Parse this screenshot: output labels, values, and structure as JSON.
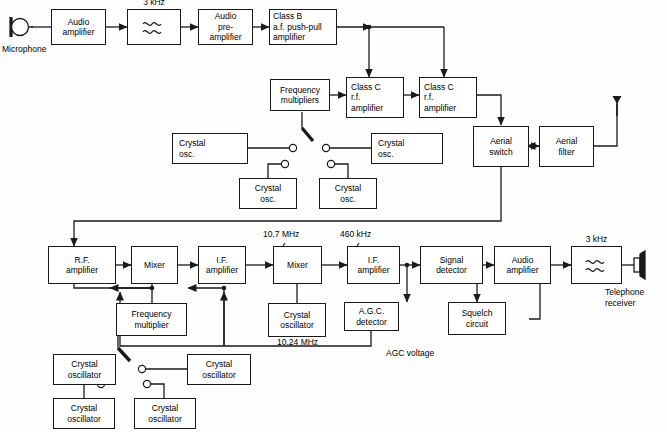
{
  "diagram": {
    "transmitter": {
      "microphone_label": "Microphone",
      "blocks": [
        {
          "id": "audio-amplifier-tx",
          "lines": [
            "Audio",
            "amplifier"
          ]
        },
        {
          "id": "af-filter-tx",
          "lines": []
        },
        {
          "id": "audio-pre-amplifier",
          "lines": [
            "Audio",
            "pre-",
            "amplifier"
          ]
        },
        {
          "id": "class-b-af-push-pull-amplifier",
          "lines": [
            "Class B",
            "a.f. push-pull",
            "amplifier"
          ]
        },
        {
          "id": "frequency-multipliers",
          "lines": [
            "Frequency",
            "multipliers"
          ]
        },
        {
          "id": "class-c-rf-amplifier-1",
          "lines": [
            "Class C",
            "r.f.",
            "amplifier"
          ]
        },
        {
          "id": "class-c-rf-amplifier-2",
          "lines": [
            "Class C",
            "r.f.",
            "amplifier"
          ]
        },
        {
          "id": "aerial-switch",
          "lines": [
            "Aerial",
            "switch"
          ]
        },
        {
          "id": "aerial-filter",
          "lines": [
            "Aerial",
            "filter"
          ]
        }
      ],
      "filter_label": "3 kHz",
      "crystal_oscillators": [
        {
          "id": "tx-xo-1",
          "lines": [
            "Crystal",
            "osc."
          ]
        },
        {
          "id": "tx-xo-2",
          "lines": [
            "Crystal",
            "osc."
          ]
        },
        {
          "id": "tx-xo-3",
          "lines": [
            "Crystal",
            "osc."
          ]
        },
        {
          "id": "tx-xo-4",
          "lines": [
            "Crystal",
            "osc."
          ]
        }
      ]
    },
    "receiver": {
      "blocks": [
        {
          "id": "rf-amplifier",
          "lines": [
            "R.F.",
            "amplifier"
          ]
        },
        {
          "id": "mixer-1",
          "lines": [
            "Mixer"
          ]
        },
        {
          "id": "if-amplifier-1",
          "lines": [
            "I.F.",
            "amplifier"
          ]
        },
        {
          "id": "mixer-2",
          "lines": [
            "Mixer"
          ]
        },
        {
          "id": "if-amplifier-2",
          "lines": [
            "I.F.",
            "amplifier"
          ]
        },
        {
          "id": "signal-detector",
          "lines": [
            "Signal",
            "detector"
          ]
        },
        {
          "id": "audio-amplifier-rx",
          "lines": [
            "Audio",
            "amplifier"
          ]
        },
        {
          "id": "af-filter-rx",
          "lines": []
        },
        {
          "id": "frequency-multiplier",
          "lines": [
            "Frequency",
            "multiplier"
          ]
        },
        {
          "id": "crystal-oscillator-10-24",
          "lines": [
            "Crystal",
            "oscillator"
          ]
        },
        {
          "id": "agc-detector",
          "lines": [
            "A.G.C.",
            "detector"
          ]
        },
        {
          "id": "squelch-circuit",
          "lines": [
            "Squelch",
            "circuit"
          ]
        }
      ],
      "crystal_oscillators": [
        {
          "id": "rx-xo-1",
          "lines": [
            "Crystal",
            "oscillator"
          ]
        },
        {
          "id": "rx-xo-2",
          "lines": [
            "Crystal",
            "oscillator"
          ]
        },
        {
          "id": "rx-xo-3",
          "lines": [
            "Crystal",
            "oscillator"
          ]
        },
        {
          "id": "rx-xo-4",
          "lines": [
            "Crystal",
            "oscillator"
          ]
        }
      ],
      "labels": {
        "first_if": "10.7 MHz",
        "second_if": "460 kHz",
        "local_osc": "10.24 MHz",
        "agc_voltage": "AGC voltage",
        "af_filter": "3 kHz",
        "output_transducer": "Telephone\nreceiver",
        "output_transducer_line1": "Telephone",
        "output_transducer_line2": "receiver"
      }
    },
    "colors": {
      "line": "#1a1a1a",
      "background": "#ffffff",
      "text": "#000000"
    }
  }
}
